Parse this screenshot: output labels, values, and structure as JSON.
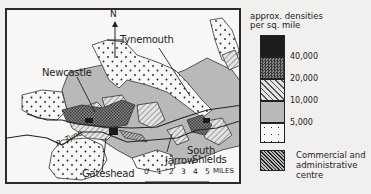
{
  "figure": {
    "type": "population-density-map",
    "region": "Tyneside",
    "north_arrow": {
      "label": "N"
    },
    "place_labels": {
      "tynemouth": "Tynemouth",
      "newcastle": "Newcastle",
      "south_shields_line1": "South",
      "south_shields_line2": "Shields",
      "jarrow": "Jarrow",
      "gateshead": "Gateshead",
      "river": "R. Tyne"
    },
    "scale": {
      "ticks": [
        "0",
        "1",
        "2",
        "3",
        "4",
        "5"
      ],
      "unit": "MILES"
    },
    "legend": {
      "title_line1": "approx. densities",
      "title_line2": "per sq. mile",
      "classes": [
        {
          "name": "over-40000",
          "fill": "#1c1c1c",
          "pattern": "solid-black"
        },
        {
          "name": "20000-40000",
          "fill": "#6a6a6a",
          "pattern": "checker",
          "upper_label": "40,000"
        },
        {
          "name": "10000-20000",
          "fill": "#d9d9d9",
          "pattern": "diagonal-hatch",
          "upper_label": "20,000"
        },
        {
          "name": "5000-10000",
          "fill": "#b9b9b9",
          "pattern": "light-grey",
          "upper_label": "10,000"
        },
        {
          "name": "under-5000",
          "fill": "#f7f7f5",
          "pattern": "dots",
          "upper_label": "5,000"
        }
      ],
      "commercial": {
        "label_line1": "Commercial and",
        "label_line2": "administrative centre",
        "pattern": "dense-diagonal-hatch"
      }
    }
  }
}
